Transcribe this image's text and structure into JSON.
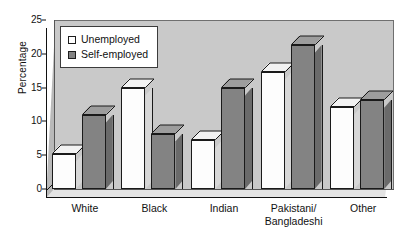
{
  "chart_data": {
    "type": "bar",
    "title": "",
    "xlabel": "",
    "ylabel": "Percentage",
    "ylim": [
      0,
      25
    ],
    "yticks": [
      0,
      5,
      10,
      15,
      20,
      25
    ],
    "grid": false,
    "legend_position": "top-left",
    "categories": [
      "White",
      "Black",
      "Indian",
      "Pakistani/\nBangladeshi",
      "Other"
    ],
    "series": [
      {
        "name": "Unemployed",
        "color": "#ffffff",
        "values": [
          5.2,
          15.0,
          7.2,
          17.3,
          12.2
        ]
      },
      {
        "name": "Self-employed",
        "color": "#838383",
        "values": [
          11.0,
          8.2,
          15.0,
          21.3,
          13.2
        ]
      }
    ]
  },
  "legend": {
    "items": [
      {
        "label": "Unemployed",
        "swatch": "white"
      },
      {
        "label": "Self-employed",
        "swatch": "gray"
      }
    ]
  },
  "colors": {
    "plot_background": "#c9c9c9",
    "page_background": "#ffffff",
    "bar_unemployed": "#ffffff",
    "bar_selfemployed": "#838383",
    "axis": "#111111"
  }
}
